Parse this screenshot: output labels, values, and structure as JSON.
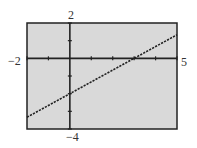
{
  "chart_data": {
    "type": "line",
    "title": "",
    "xlabel": "",
    "ylabel": "",
    "xlim": [
      -2,
      5
    ],
    "ylim": [
      -4,
      2
    ],
    "x_tick_step": 1,
    "y_tick_step": 1,
    "grid": false,
    "window_labels": {
      "xmin": "−2",
      "xmax": "5",
      "ymax": "2",
      "ymin": "−4"
    },
    "series": [
      {
        "name": "y = (2/3)x - 2",
        "style": "dotted",
        "x": [
          -2,
          5
        ],
        "y": [
          -3.333,
          1.333
        ]
      }
    ],
    "x_intercept": 3,
    "y_intercept": -2
  },
  "colors": {
    "plot_bg": "#d9d9d9",
    "frame": "#222222",
    "line": "#222222"
  }
}
